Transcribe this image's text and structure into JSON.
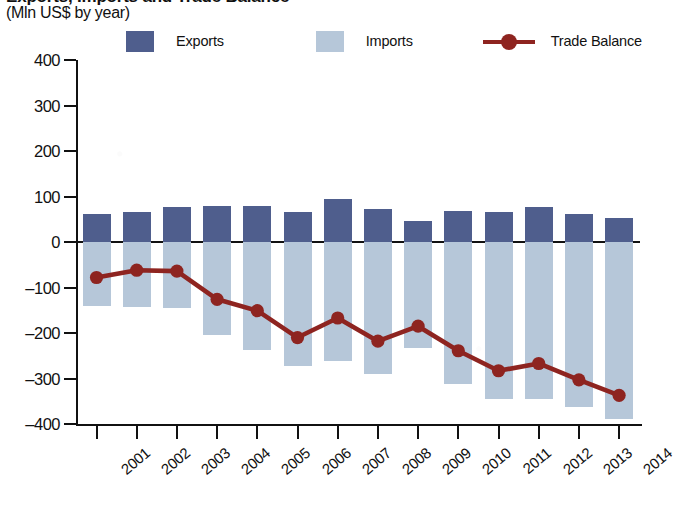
{
  "header": {
    "title_partial": "Exports, Imports and Trade Balance",
    "subtitle": "(Mln US$ by year)"
  },
  "legend": {
    "position": "top",
    "items": [
      {
        "label": "Exports",
        "marker": "square-swatch",
        "color": "#4f5e8d"
      },
      {
        "label": "Imports",
        "marker": "square-swatch",
        "color": "#b6c7d9"
      },
      {
        "label": "Trade Balance",
        "marker": "line-with-circle",
        "color": "#8e2420"
      }
    ]
  },
  "axes": {
    "y_ticks": [
      "400",
      "300",
      "200",
      "100",
      "0",
      "–100",
      "–200",
      "–300",
      "–400"
    ],
    "x_ticks": [
      "2001",
      "2002",
      "2003",
      "2004",
      "2005",
      "2006",
      "2007",
      "2008",
      "2009",
      "2010",
      "2011",
      "2012",
      "2013",
      "2014"
    ]
  },
  "chart_data": {
    "type": "bar",
    "title": "Exports, Imports and Trade Balance",
    "subtitle": "(Mln US$ by year)",
    "xlabel": "",
    "ylabel": "Mln US$",
    "ylim": [
      -400,
      400
    ],
    "ytick_step": 100,
    "grid": false,
    "legend_position": "top",
    "categories": [
      "2001",
      "2002",
      "2003",
      "2004",
      "2005",
      "2006",
      "2007",
      "2008",
      "2009",
      "2010",
      "2011",
      "2012",
      "2013",
      "2014"
    ],
    "series": [
      {
        "name": "Exports",
        "type": "bar",
        "color": "#4f5e8d",
        "values": [
          62,
          67,
          77,
          80,
          80,
          65,
          95,
          72,
          47,
          68,
          65,
          76,
          61,
          53
        ]
      },
      {
        "name": "Imports",
        "type": "bar",
        "color": "#b6c7d9",
        "values": [
          -140,
          -143,
          -144,
          -205,
          -237,
          -273,
          -262,
          -290,
          -232,
          -312,
          -345,
          -344,
          -362,
          -390
        ]
      },
      {
        "name": "Trade Balance",
        "type": "line",
        "color": "#8e2420",
        "values": [
          -78,
          -62,
          -64,
          -126,
          -151,
          -210,
          -167,
          -218,
          -185,
          -239,
          -283,
          -267,
          -303,
          -337
        ]
      }
    ]
  }
}
